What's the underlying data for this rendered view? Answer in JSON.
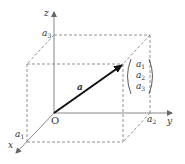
{
  "diagram": {
    "type": "3d-coordinate-vector",
    "axes": {
      "x": {
        "label": "x",
        "tick_label": "a",
        "tick_sub": "1"
      },
      "y": {
        "label": "y",
        "tick_label": "a",
        "tick_sub": "2"
      },
      "z": {
        "label": "z",
        "tick_label": "a",
        "tick_sub": "3"
      }
    },
    "origin_label": "O",
    "vector": {
      "label": "a",
      "components": [
        {
          "base": "a",
          "sub": "1"
        },
        {
          "base": "a",
          "sub": "2"
        },
        {
          "base": "a",
          "sub": "3"
        }
      ]
    },
    "colors": {
      "axis": "#888888",
      "vector": "#111111",
      "dashed": "#777777",
      "text": "#333333"
    }
  }
}
